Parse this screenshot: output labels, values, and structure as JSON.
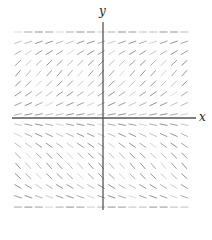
{
  "diagram": {
    "type": "slope-field",
    "axes": {
      "x_label": "x",
      "y_label": "y",
      "color": "#555555"
    },
    "field": {
      "columns": 17,
      "rows": 17,
      "x_start": 18,
      "y_start": 32,
      "spacing": 10.6,
      "segment_length": 8,
      "color": "#444444",
      "row_slopes": [
        0.0,
        0.35,
        0.6,
        0.95,
        1.15,
        1.0,
        0.7,
        0.45,
        0.2,
        -0.2,
        -0.45,
        -0.7,
        -1.0,
        -1.15,
        -0.95,
        -0.6,
        -0.35,
        0.0
      ]
    }
  }
}
